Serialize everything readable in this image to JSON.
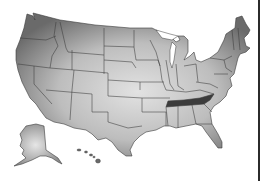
{
  "map": {
    "subject": "United States map",
    "style": "grayscale gradient states with borders",
    "highlighted_state": "Tennessee",
    "highlight_color": "#3c3c3c",
    "base_colors": {
      "dark": "#6e6e6e",
      "light": "#dcdcdc",
      "border": "#3a3a3a"
    },
    "insets": [
      "Alaska",
      "Hawaii"
    ]
  }
}
